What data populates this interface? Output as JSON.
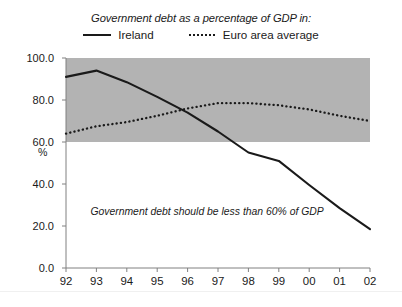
{
  "chart_data": {
    "type": "line",
    "title": "Government debt as a percentage of GDP in:",
    "xlabel": "",
    "ylabel": "%",
    "x": [
      "92",
      "93",
      "94",
      "95",
      "96",
      "97",
      "98",
      "99",
      "00",
      "01",
      "02"
    ],
    "ylim": [
      0.0,
      100.0
    ],
    "y_ticks": [
      "0.0",
      "20.0",
      "40.0",
      "60.0",
      "80.0",
      "100.0"
    ],
    "y_tick_values": [
      0.0,
      20.0,
      40.0,
      60.0,
      80.0,
      100.0
    ],
    "grid": false,
    "legend_position": "top-center",
    "series": [
      {
        "name": "Ireland",
        "style": "solid",
        "color": "#1a1a1a",
        "values": [
          91.0,
          94.0,
          88.5,
          81.5,
          74.0,
          65.0,
          55.0,
          51.0,
          39.5,
          28.5,
          18.5
        ]
      },
      {
        "name": "Euro area average",
        "style": "dotted",
        "color": "#1a1a1a",
        "values": [
          64.0,
          67.5,
          69.5,
          72.5,
          76.0,
          78.5,
          78.5,
          77.5,
          75.5,
          72.5,
          70.0
        ]
      }
    ],
    "shaded_band": {
      "label": "Government debt should be less than 60% of GDP",
      "from": 60.0,
      "to": 100.0,
      "color": "#b3b3b3"
    },
    "annotations": [
      {
        "text": "Government debt should be less than 60% of GDP",
        "x": "93",
        "y": 26.0
      }
    ]
  },
  "colors": {
    "band": "#b3b3b3",
    "line": "#1a1a1a",
    "axis": "#808080",
    "background": "#ffffff"
  },
  "legend": {
    "title": "Government debt as a percentage of GDP in:",
    "items": [
      {
        "label": "Ireland",
        "style": "solid"
      },
      {
        "label": "Euro area average",
        "style": "dotted"
      }
    ]
  },
  "axis": {
    "unit_label": "%"
  }
}
